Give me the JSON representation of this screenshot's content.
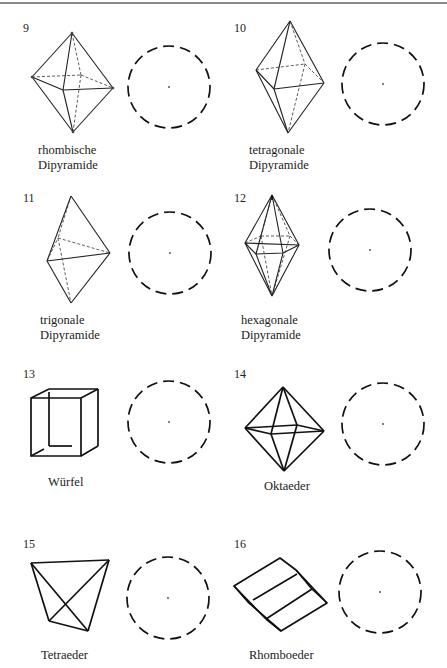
{
  "page": {
    "marker": "",
    "figures": [
      {
        "number": "9",
        "label_line1": "rhombische",
        "label_line2": "Dipyramide"
      },
      {
        "number": "10",
        "label_line1": "tetragonale",
        "label_line2": "Dipyramide"
      },
      {
        "number": "11",
        "label_line1": "trigonale",
        "label_line2": "Dipyramide"
      },
      {
        "number": "12",
        "label_line1": "hexagonale",
        "label_line2": "Dipyramide"
      },
      {
        "number": "13",
        "label_line1": "Würfel",
        "label_line2": ""
      },
      {
        "number": "14",
        "label_line1": "Oktaeder",
        "label_line2": ""
      },
      {
        "number": "15",
        "label_line1": "Tetraeder",
        "label_line2": ""
      },
      {
        "number": "16",
        "label_line1": "Rhomboeder",
        "label_line2": ""
      }
    ],
    "projection_circle": {
      "style": "dashed",
      "center_dot": true
    }
  }
}
